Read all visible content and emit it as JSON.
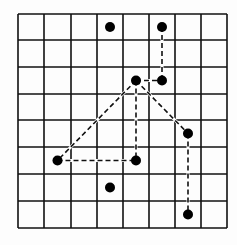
{
  "diagram": {
    "type": "grid-graph",
    "grid": {
      "cols": 8,
      "rows": 8,
      "x_lines": [
        18,
        44,
        71,
        97,
        123,
        149,
        175,
        201,
        227
      ],
      "y_lines": [
        14,
        40,
        67,
        94,
        120,
        147,
        174,
        201,
        228
      ],
      "line_color": "#111111"
    },
    "nodes": [
      {
        "id": "a",
        "col": 3,
        "row": 0
      },
      {
        "id": "b",
        "col": 5,
        "row": 0
      },
      {
        "id": "c",
        "col": 4,
        "row": 2
      },
      {
        "id": "d",
        "col": 5,
        "row": 2
      },
      {
        "id": "e",
        "col": 6,
        "row": 4
      },
      {
        "id": "f",
        "col": 1,
        "row": 5
      },
      {
        "id": "g",
        "col": 4,
        "row": 5
      },
      {
        "id": "h",
        "col": 3,
        "row": 6
      },
      {
        "id": "i",
        "col": 6,
        "row": 7
      }
    ],
    "edges": [
      {
        "from": "b",
        "to": "d",
        "style": "dashed"
      },
      {
        "from": "c",
        "to": "d",
        "style": "dashed"
      },
      {
        "from": "c",
        "to": "f",
        "style": "dashed"
      },
      {
        "from": "c",
        "to": "g",
        "style": "dashed"
      },
      {
        "from": "f",
        "to": "g",
        "style": "dashed"
      },
      {
        "from": "c",
        "to": "e",
        "style": "dashed"
      },
      {
        "from": "e",
        "to": "i",
        "style": "dashed"
      }
    ],
    "node_color": "#000000",
    "node_radius": 5
  }
}
